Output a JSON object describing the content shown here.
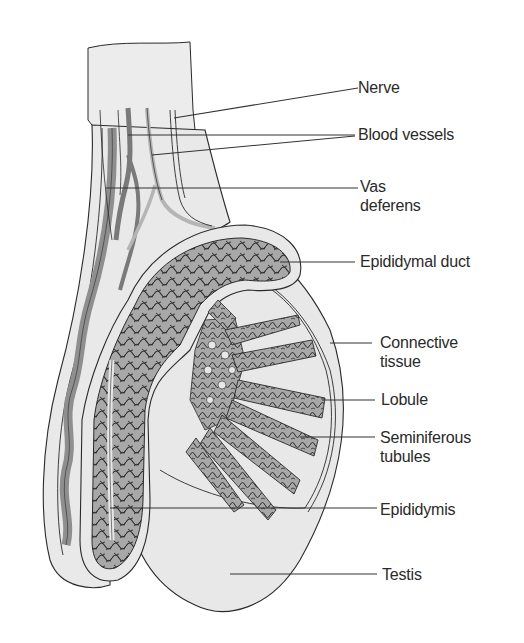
{
  "diagram": {
    "colors": {
      "background": "#ffffff",
      "tissue_fill": "#ebebeb",
      "tubule_fill": "#a8a8a8",
      "outline": "#2a2a2a",
      "leader_line": "#333333"
    },
    "labels": [
      {
        "id": "nerve",
        "text": "Nerve",
        "x": 358,
        "y": 78
      },
      {
        "id": "blood-vessels",
        "text": "Blood vessels",
        "x": 358,
        "y": 125
      },
      {
        "id": "vas-deferens",
        "text": "Vas\ndeferens",
        "x": 360,
        "y": 177
      },
      {
        "id": "epididymal-duct",
        "text": "Epididymal duct",
        "x": 360,
        "y": 252
      },
      {
        "id": "connective-tissue",
        "text": "Connective\ntissue",
        "x": 380,
        "y": 333
      },
      {
        "id": "lobule",
        "text": "Lobule",
        "x": 381,
        "y": 390
      },
      {
        "id": "seminiferous-tubules",
        "text": "Seminiferous\ntubules",
        "x": 380,
        "y": 428
      },
      {
        "id": "epididymis",
        "text": "Epididymis",
        "x": 380,
        "y": 500
      },
      {
        "id": "testis",
        "text": "Testis",
        "x": 382,
        "y": 565
      }
    ]
  }
}
